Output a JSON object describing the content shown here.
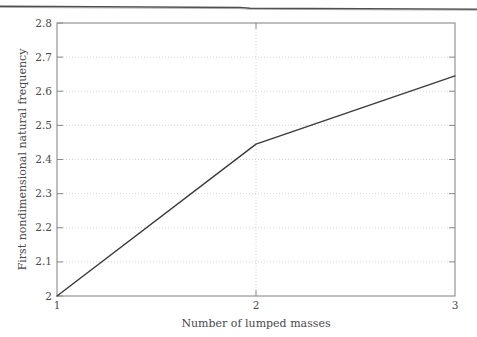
{
  "figure": {
    "name": "first-nondimensional-natural-frequency-vs-lumped-masses",
    "background_color": "#ffffff",
    "scan_artifact_color": "#5a5a5a"
  },
  "chart_data": {
    "type": "line",
    "title": "",
    "subtitle": "",
    "xlabel": "Number of lumped masses",
    "ylabel": "First nondimensional natural frequency",
    "x": [
      1,
      2,
      3
    ],
    "values": [
      2.0,
      2.445,
      2.645
    ],
    "series": [
      {
        "name": "First nondimensional natural frequency",
        "x": [
          1,
          2,
          3
        ],
        "values": [
          2.0,
          2.445,
          2.645
        ],
        "color": "#3a3a3a",
        "line_width": 1.4,
        "marker": "none"
      }
    ],
    "xlim": [
      1,
      3
    ],
    "ylim": [
      2.0,
      2.8
    ],
    "xticks": [
      1,
      2,
      3
    ],
    "xtick_labels": [
      "1",
      "2",
      "3"
    ],
    "yticks": [
      2.0,
      2.1,
      2.2,
      2.3,
      2.4,
      2.5,
      2.6,
      2.7,
      2.8
    ],
    "ytick_labels": [
      "2",
      "2.1",
      "2.2",
      "2.3",
      "2.4",
      "2.5",
      "2.6",
      "2.7",
      "2.8"
    ],
    "grid": true,
    "grid_style": "dotted",
    "grid_color": "#c9c9c9",
    "legend": null,
    "legend_position": "none",
    "annotations": [],
    "axis_color": "#808080",
    "tick_direction": "in"
  }
}
